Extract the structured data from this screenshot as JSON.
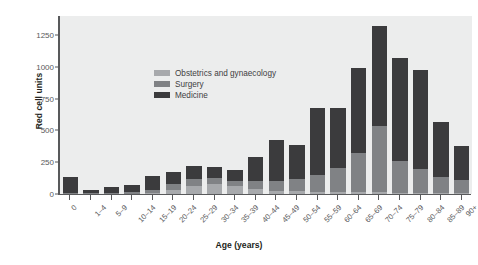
{
  "chart_data": {
    "type": "bar",
    "stacked": true,
    "title": "",
    "xlabel": "Age (years)",
    "ylabel": "Red cell units",
    "ylim": [
      0,
      1400
    ],
    "yticks": [
      0,
      250,
      500,
      750,
      1000,
      1250
    ],
    "grid": false,
    "legend_position": "upper-left-inside",
    "categories": [
      "0",
      "1–4",
      "5–9",
      "10–14",
      "15–19",
      "20–24",
      "25–29",
      "30–34",
      "35–39",
      "40–44",
      "45–49",
      "50–54",
      "55–59",
      "60–64",
      "65–69",
      "70–74",
      "75–79",
      "80–84",
      "85–89",
      "90+"
    ],
    "series": [
      {
        "name": "Obstetrics and gynaecology",
        "color": "#a7a9ac",
        "values": [
          0,
          0,
          0,
          0,
          5,
          35,
          60,
          75,
          60,
          40,
          25,
          20,
          15,
          15,
          15,
          15,
          10,
          5,
          5,
          5
        ]
      },
      {
        "name": "Surgery",
        "color": "#808285",
        "values": [
          10,
          10,
          10,
          15,
          25,
          45,
          55,
          50,
          45,
          60,
          80,
          95,
          135,
          190,
          310,
          520,
          250,
          190,
          125,
          105
        ]
      },
      {
        "name": "Medicine",
        "color": "#3b3b3d",
        "values": [
          120,
          25,
          45,
          55,
          115,
          95,
          105,
          90,
          85,
          195,
          320,
          270,
          530,
          475,
          665,
          785,
          810,
          780,
          435,
          265
        ]
      }
    ],
    "totals": [
      130,
      35,
      55,
      70,
      145,
      175,
      220,
      215,
      190,
      295,
      425,
      385,
      680,
      680,
      990,
      1320,
      1070,
      975,
      565,
      375
    ]
  },
  "legend": {
    "items": [
      {
        "label": "Obstetrics and gynaecology",
        "color": "#a7a9ac"
      },
      {
        "label": "Surgery",
        "color": "#808285"
      },
      {
        "label": "Medicine",
        "color": "#3b3b3d"
      }
    ]
  }
}
